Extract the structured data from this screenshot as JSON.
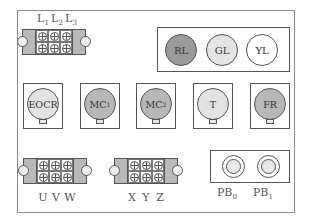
{
  "diagram": {
    "type": "control-panel-layout",
    "colors": {
      "dark_gray": "#9a9a9a",
      "mid_gray": "#b8b8b8",
      "light_gray": "#e3e3e3",
      "white": "#ffffff",
      "line": "#555555"
    },
    "power_terminal": {
      "labels": [
        {
          "base": "L",
          "sub": "1"
        },
        {
          "base": "L",
          "sub": "2"
        },
        {
          "base": "L",
          "sub": "3"
        }
      ]
    },
    "pilot_lamps": [
      {
        "label": "RL",
        "fill": "#9a9a9a"
      },
      {
        "label": "GL",
        "fill": "#e3e3e3"
      },
      {
        "label": "YL",
        "fill": "#ffffff"
      }
    ],
    "relays": [
      {
        "base": "EOCR",
        "sub": "",
        "fill": "#e3e3e3"
      },
      {
        "base": "MC",
        "sub": "1",
        "fill": "#b8b8b8"
      },
      {
        "base": "MC",
        "sub": "2",
        "fill": "#b8b8b8"
      },
      {
        "base": "T",
        "sub": "",
        "fill": "#e3e3e3"
      },
      {
        "base": "FR",
        "sub": "",
        "fill": "#b8b8b8"
      }
    ],
    "motor_terminal": {
      "labels": [
        "U",
        "V",
        "W"
      ]
    },
    "aux_terminal": {
      "labels": [
        "X",
        "Y",
        "Z"
      ]
    },
    "push_buttons": [
      {
        "base": "PB",
        "sub": "0"
      },
      {
        "base": "PB",
        "sub": "1"
      }
    ]
  }
}
